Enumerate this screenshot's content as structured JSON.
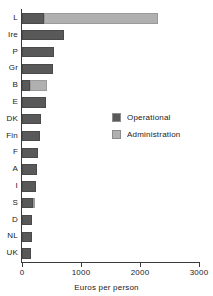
{
  "chart_data": {
    "type": "bar",
    "orientation": "horizontal",
    "stacked": true,
    "title": "",
    "xlabel": "Euros per person",
    "ylabel": "",
    "xlim": [
      0,
      3000
    ],
    "xticks": [
      0,
      1000,
      2000,
      3000
    ],
    "xtick_labels": [
      "0",
      "1000",
      "2000",
      "3000"
    ],
    "grid": false,
    "legend_position": "inside-right",
    "categories": [
      "L",
      "Ire",
      "P",
      "Gr",
      "B",
      "E",
      "DK",
      "Fin",
      "F",
      "A",
      "I",
      "S",
      "D",
      "NL",
      "UK"
    ],
    "series": [
      {
        "name": "Operational",
        "color": "#595959",
        "values": [
          380,
          710,
          540,
          525,
          140,
          410,
          320,
          305,
          270,
          250,
          235,
          190,
          170,
          165,
          160
        ]
      },
      {
        "name": "Administration",
        "color": "#b0b0b0",
        "values": [
          1925,
          0,
          0,
          0,
          285,
          0,
          0,
          0,
          0,
          0,
          0,
          30,
          0,
          0,
          0
        ]
      }
    ],
    "totals": [
      2305,
      710,
      540,
      525,
      425,
      410,
      320,
      305,
      270,
      250,
      235,
      220,
      170,
      165,
      160
    ]
  },
  "legend": {
    "items": [
      {
        "label": "Operational",
        "color": "#595959"
      },
      {
        "label": "Administration",
        "color": "#b0b0b0"
      }
    ]
  },
  "axis": {
    "x_title": "Euros per person"
  }
}
